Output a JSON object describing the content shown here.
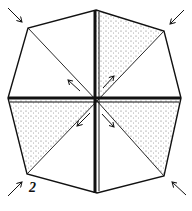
{
  "diagram": {
    "type": "origami-fold-step",
    "step_number": "2",
    "colors": {
      "ink": "#111111",
      "paper": "#ffffff",
      "stipple": "#555555"
    },
    "outline": {
      "shape": "octagon",
      "vertices": [
        [
          96,
          10
        ],
        [
          164,
          31
        ],
        [
          181,
          98
        ],
        [
          164,
          176
        ],
        [
          97,
          193
        ],
        [
          27,
          174
        ],
        [
          8,
          98
        ],
        [
          28,
          28
        ]
      ]
    },
    "center": [
      97,
      101
    ],
    "creases": [
      "center-to-each-vertex (8 radial creases)"
    ],
    "shaded_regions": [
      "top-right upper triangle",
      "left lower triangle",
      "right lower triangle",
      "bottom-right upper triangle"
    ],
    "arrows": {
      "outer": [
        "top-left pointing in",
        "top-right pointing in",
        "bottom-left pointing in",
        "bottom-right pointing in"
      ],
      "inner": [
        "pointing up-left",
        "pointing up-right",
        "pointing down-left",
        "pointing down-right"
      ]
    }
  }
}
